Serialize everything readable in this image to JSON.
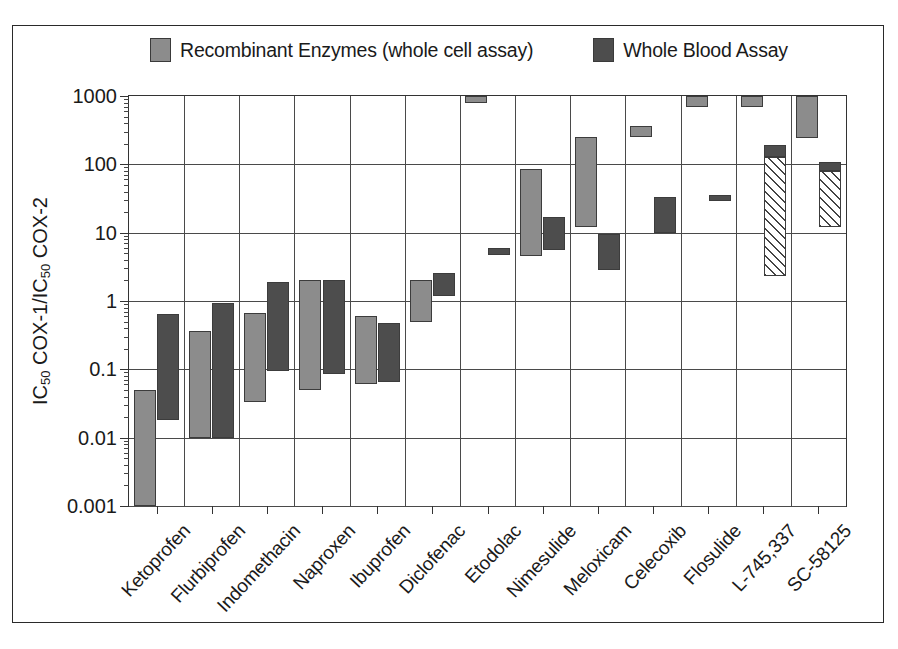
{
  "figure": {
    "frame": true
  },
  "legend": {
    "position": "top",
    "entries": [
      {
        "label": "Recombinant Enzymes (whole cell assay)",
        "swatch": "light-gray-square-icon",
        "color": "#8c8c8c"
      },
      {
        "label": "Whole Blood Assay",
        "swatch": "dark-gray-square-icon",
        "color": "#4d4d4d"
      }
    ]
  },
  "chart_data": {
    "type": "bar",
    "subtype": "floating-range-bars",
    "title": "",
    "xlabel": "",
    "ylabel": "IC50 COX-1/IC50 COX-2",
    "ylabel_parts": {
      "pre": "IC",
      "sub1": "50",
      "mid": " COX-1/IC",
      "sub2": "50",
      "post": " COX-2"
    },
    "yscale": "log",
    "ylim": [
      0.001,
      1000
    ],
    "ytick_labels": [
      "1000",
      "100",
      "10",
      "1",
      "0.1",
      "0.01",
      "0.001"
    ],
    "ytick_values": [
      1000,
      100,
      10,
      1,
      0.1,
      0.01,
      0.001
    ],
    "grid": "both",
    "categories": [
      "Ketoprofen",
      "Flurbiprofen",
      "Indomethacin",
      "Naproxen",
      "Ibuprofen",
      "Diclofenac",
      "Etodolac",
      "Nimesulide",
      "Meloxicam",
      "Celecoxib",
      "Flosulide",
      "L-745,337",
      "SC-58125"
    ],
    "series": [
      {
        "name": "Recombinant Enzymes (whole cell assay)",
        "style": "light",
        "color": "#8c8c8c",
        "ranges": [
          {
            "category": "Ketoprofen",
            "low": 0.001,
            "high": 0.05
          },
          {
            "category": "Flurbiprofen",
            "low": 0.01,
            "high": 0.37
          },
          {
            "category": "Indomethacin",
            "low": 0.033,
            "high": 0.67
          },
          {
            "category": "Naproxen",
            "low": 0.05,
            "high": 2.0
          },
          {
            "category": "Ibuprofen",
            "low": 0.062,
            "high": 0.6
          },
          {
            "category": "Diclofenac",
            "low": 0.5,
            "high": 2.0
          },
          {
            "category": "Etodolac",
            "low": 800,
            "high": 1000
          },
          {
            "category": "Nimesulide",
            "low": 4.5,
            "high": 85
          },
          {
            "category": "Meloxicam",
            "low": 12,
            "high": 250
          },
          {
            "category": "Celecoxib",
            "low": 250,
            "high": 370
          },
          {
            "category": "Flosulide",
            "low": 700,
            "high": 1000
          },
          {
            "category": "L-745,337",
            "low": 700,
            "high": 1000
          },
          {
            "category": "SC-58125",
            "low": 240,
            "high": 1000
          }
        ]
      },
      {
        "name": "Whole Blood Assay",
        "style": "dark",
        "color": "#4d4d4d",
        "ranges": [
          {
            "category": "Ketoprofen",
            "low": 0.018,
            "high": 0.65
          },
          {
            "category": "Flurbiprofen",
            "low": 0.01,
            "high": 0.95
          },
          {
            "category": "Indomethacin",
            "low": 0.093,
            "high": 1.9
          },
          {
            "category": "Naproxen",
            "low": 0.085,
            "high": 2.0
          },
          {
            "category": "Ibuprofen",
            "low": 0.065,
            "high": 0.47
          },
          {
            "category": "Diclofenac",
            "low": 1.2,
            "high": 2.6
          },
          {
            "category": "Etodolac",
            "low": 4.7,
            "high": 5.9
          },
          {
            "category": "Nimesulide",
            "low": 5.5,
            "high": 17
          },
          {
            "category": "Meloxicam",
            "low": 2.8,
            "high": 9.5
          },
          {
            "category": "Celecoxib",
            "low": 10,
            "high": 33
          },
          {
            "category": "Flosulide",
            "low": 29,
            "high": 36
          },
          {
            "category": "L-745,337",
            "low": 130,
            "high": 190
          },
          {
            "category": "SC-58125",
            "low": 80,
            "high": 110
          }
        ]
      },
      {
        "name": "Hatched range",
        "style": "hatch",
        "color": "#ffffff",
        "ranges": [
          {
            "category": "L-745,337",
            "low": 2.3,
            "high": 130
          },
          {
            "category": "SC-58125",
            "low": 12,
            "high": 80
          }
        ]
      }
    ]
  }
}
